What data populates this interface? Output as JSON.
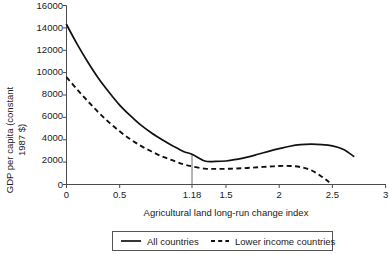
{
  "chart_data": {
    "type": "line",
    "title": "",
    "xlabel": "Agricultural land long-run change index",
    "ylabel": "GDP per capita (constant 1987 $)",
    "ylabel_line1": "GDP per capita (constant",
    "ylabel_line2": "1987 $)",
    "xlim": [
      0,
      3
    ],
    "ylim": [
      0,
      16000
    ],
    "grid": false,
    "legend_position": "bottom",
    "x_ticks": [
      "0",
      "0.5",
      "1.18",
      "1.5",
      "2",
      "2.5",
      "3"
    ],
    "x_tick_values": [
      0,
      0.5,
      1.18,
      1.5,
      2,
      2.5,
      3
    ],
    "y_ticks": [
      "0",
      "2000",
      "4000",
      "6000",
      "8000",
      "10000",
      "12000",
      "14000",
      "16000"
    ],
    "y_tick_values": [
      0,
      2000,
      4000,
      6000,
      8000,
      10000,
      12000,
      14000,
      16000
    ],
    "annotations": [
      {
        "name": "threshold-marker",
        "x": 1.18,
        "label": "1.18",
        "description": "vertical reference line at x = 1.18 from axis up to All countries curve"
      }
    ],
    "series": [
      {
        "name": "All countries",
        "style": "solid",
        "color": "#111111",
        "x": [
          0.0,
          0.1,
          0.2,
          0.3,
          0.4,
          0.5,
          0.6,
          0.7,
          0.8,
          0.9,
          1.0,
          1.1,
          1.18,
          1.3,
          1.4,
          1.5,
          1.6,
          1.7,
          1.8,
          1.9,
          2.0,
          2.1,
          2.2,
          2.3,
          2.4,
          2.5,
          2.6,
          2.7
        ],
        "y": [
          14300,
          12550,
          10950,
          9500,
          8250,
          7100,
          6150,
          5300,
          4600,
          4000,
          3450,
          2950,
          2700,
          2100,
          2060,
          2100,
          2250,
          2450,
          2700,
          2960,
          3200,
          3420,
          3560,
          3600,
          3570,
          3450,
          3150,
          2520
        ]
      },
      {
        "name": "Lower income countries",
        "style": "dashed",
        "color": "#111111",
        "x": [
          0.0,
          0.1,
          0.2,
          0.3,
          0.4,
          0.5,
          0.6,
          0.7,
          0.8,
          0.9,
          1.0,
          1.1,
          1.18,
          1.3,
          1.4,
          1.5,
          1.6,
          1.7,
          1.8,
          1.9,
          2.0,
          2.1,
          2.2,
          2.3,
          2.4,
          2.47
        ],
        "y": [
          9600,
          8500,
          7450,
          6450,
          5550,
          4750,
          4050,
          3450,
          2950,
          2500,
          2150,
          1800,
          1620,
          1420,
          1400,
          1400,
          1430,
          1480,
          1540,
          1600,
          1650,
          1660,
          1560,
          1280,
          700,
          210
        ]
      }
    ]
  },
  "legend": {
    "items": [
      {
        "label": "All countries",
        "style": "solid"
      },
      {
        "label": "Lower income countries",
        "style": "dashed"
      }
    ]
  }
}
